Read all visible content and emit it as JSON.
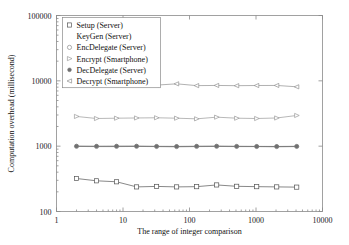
{
  "chart_data": {
    "type": "line",
    "title": "",
    "xlabel": "The range of integer comparison",
    "ylabel": "Computation overhead (millisecond)",
    "xscale": "log",
    "yscale": "log",
    "xlim": [
      1,
      10000
    ],
    "ylim": [
      100,
      100000
    ],
    "xticks": [
      1,
      10,
      100,
      1000,
      10000
    ],
    "xtick_labels": [
      "1",
      "10",
      "100",
      "1000",
      "10000"
    ],
    "yticks": [
      100,
      1000,
      10000,
      100000
    ],
    "ytick_labels": [
      "100",
      "1000",
      "10000",
      "100000"
    ],
    "grid": false,
    "legend_position": "upper-left",
    "x": [
      2,
      4,
      8,
      16,
      32,
      64,
      128,
      256,
      512,
      1024,
      2048,
      4096
    ],
    "series": [
      {
        "name": "Setup (Server)",
        "marker": "open-square",
        "color": "#555555",
        "values": [
          320,
          295,
          285,
          238,
          242,
          238,
          240,
          255,
          243,
          240,
          238,
          236
        ]
      },
      {
        "name": "KeyGen (Server)",
        "marker": "none",
        "color": "#777777",
        "values": [
          990,
          985,
          985,
          990,
          985,
          980,
          985,
          990,
          985,
          985,
          980,
          985
        ]
      },
      {
        "name": "EncDelegate (Server)",
        "marker": "open-circle",
        "color": "#8a8a8a",
        "values": [
          995,
          990,
          992,
          995,
          988,
          985,
          990,
          995,
          990,
          988,
          985,
          990
        ]
      },
      {
        "name": "Encrypt (Smartphone)",
        "marker": "right-triangle",
        "color": "#9a9a9a",
        "values": [
          2850,
          2650,
          2680,
          2700,
          2720,
          2680,
          2620,
          2780,
          2680,
          2650,
          2700,
          2950
        ]
      },
      {
        "name": "DecDelegate (Server)",
        "marker": "filled-dot",
        "color": "#707070",
        "values": [
          1000,
          998,
          1000,
          1000,
          995,
          992,
          998,
          1000,
          995,
          992,
          990,
          995
        ]
      },
      {
        "name": "Decrypt (Smartphone)",
        "marker": "left-triangle",
        "color": "#8f8f8f",
        "values": [
          8700,
          8650,
          8680,
          8700,
          8600,
          9000,
          8450,
          8500,
          8430,
          8480,
          8500,
          8100
        ]
      }
    ]
  },
  "legend": {
    "entries": [
      "Setup (Server)",
      "KeyGen (Server)",
      "EncDelegate (Server)",
      "Encrypt (Smartphone)",
      "DecDelegate (Server)",
      "Decrypt (Smartphone)"
    ]
  }
}
